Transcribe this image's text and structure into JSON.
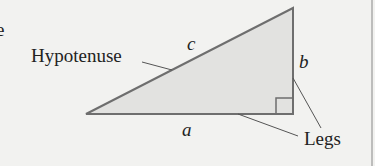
{
  "diagram": {
    "labels": {
      "hypotenuse": "Hypotenuse",
      "legs": "Legs",
      "side_a": "a",
      "side_b": "b",
      "side_c": "c"
    },
    "stray_mark": "e",
    "colors": {
      "background": "#f2f2f0",
      "triangle_fill": "#e2e2e0",
      "stroke": "#6e6e6e",
      "text": "#222222"
    }
  }
}
